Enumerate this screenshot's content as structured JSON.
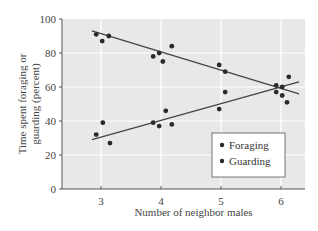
{
  "chart_data": {
    "type": "scatter",
    "title": "",
    "xlabel": "Number of neighbor males",
    "ylabel_lines": [
      "Time spent foraging or",
      "guarding (percent)"
    ],
    "ylabel": "Time spent foraging or guarding (percent)",
    "xlim": [
      2.45,
      6.45
    ],
    "ylim": [
      0,
      100
    ],
    "xticks": [
      3,
      4,
      5,
      6
    ],
    "yticks": [
      0,
      20,
      40,
      60,
      80,
      100
    ],
    "grid": true,
    "legend_position": "lower right",
    "series": [
      {
        "name": "Foraging",
        "color": "#2a2a2a",
        "points": [
          [
            2.92,
            91
          ],
          [
            3.02,
            87
          ],
          [
            3.13,
            90
          ],
          [
            3.87,
            78
          ],
          [
            3.97,
            80
          ],
          [
            4.03,
            75
          ],
          [
            4.18,
            84
          ],
          [
            4.97,
            73
          ],
          [
            5.07,
            69
          ],
          [
            5.92,
            61
          ],
          [
            6.02,
            60
          ],
          [
            6.1,
            51
          ]
        ],
        "trendline": [
          [
            2.85,
            93
          ],
          [
            6.3,
            56
          ]
        ]
      },
      {
        "name": "Guarding",
        "color": "#2a2a2a",
        "points": [
          [
            2.92,
            32
          ],
          [
            3.03,
            39
          ],
          [
            3.15,
            27
          ],
          [
            3.87,
            39
          ],
          [
            3.97,
            37
          ],
          [
            4.08,
            46
          ],
          [
            4.18,
            38
          ],
          [
            4.97,
            47
          ],
          [
            5.07,
            57
          ],
          [
            5.92,
            57
          ],
          [
            6.02,
            55
          ],
          [
            6.13,
            66
          ]
        ],
        "trendline": [
          [
            2.85,
            29
          ],
          [
            6.3,
            63
          ]
        ]
      }
    ]
  },
  "colors": {
    "plot_background": "#e8e8e8",
    "gridline": "#ffffff",
    "axis": "#555555",
    "marker": "#2a2a2a",
    "trendline": "#444444"
  }
}
